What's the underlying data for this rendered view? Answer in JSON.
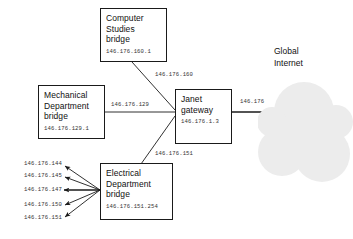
{
  "diagram": {
    "nodes": [
      {
        "id": "computer-studies-bridge",
        "title_lines": [
          "Computer",
          "Studies",
          "bridge"
        ],
        "ip": "146.176.160.1"
      },
      {
        "id": "mechanical-department-bridge",
        "title_lines": [
          "Mechanical",
          "Department",
          "bridge"
        ],
        "ip": "146.176.129.1"
      },
      {
        "id": "electrical-department-bridge",
        "title_lines": [
          "Electrical",
          "Department",
          "bridge"
        ],
        "ip": "146.176.151.254"
      },
      {
        "id": "janet-gateway",
        "title_lines": [
          "Janet",
          "gateway"
        ],
        "ip": "146.176.1.3"
      }
    ],
    "cloud": {
      "caption_lines": [
        "Global",
        "Internet"
      ],
      "fill_color": "#ececec"
    },
    "link_labels": {
      "computer_studies_to_gateway": "146.176.160",
      "mechanical_to_gateway": "146.176.129",
      "electrical_to_gateway": "146.176.151",
      "gateway_to_internet": "146.176"
    },
    "electrical_host_links": [
      "146.176.144",
      "146.176.145",
      "146.176.147",
      "146.176.150",
      "146.176.151"
    ],
    "line_color": "#1a1a1a"
  }
}
